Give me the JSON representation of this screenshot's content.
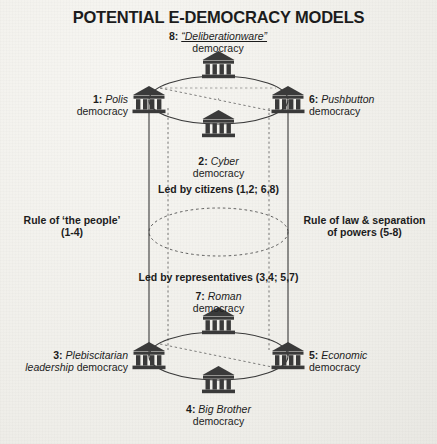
{
  "title": "POTENTIAL E-DEMOCRACY MODELS",
  "diagram": {
    "type": "double-cylinder-axis-model",
    "background_color": "#f3f2ee",
    "ink_color": "#2b2b2b",
    "icon": "greek-temple-icon",
    "nodes": [
      {
        "id": 1,
        "num": "1:",
        "name": "Polis",
        "name2": "democracy",
        "position": "top-ring-west"
      },
      {
        "id": 2,
        "num": "2:",
        "name": "Cyber",
        "name2": "democracy",
        "position": "top-ring-front"
      },
      {
        "id": 3,
        "num": "3:",
        "name": "Plebiscitarian",
        "name2": "leadership democracy",
        "position": "bottom-ring-west"
      },
      {
        "id": 4,
        "num": "4:",
        "name": "Big Brother",
        "name2": "democracy",
        "position": "bottom-ring-front"
      },
      {
        "id": 5,
        "num": "5:",
        "name": "Economic",
        "name2": "democracy",
        "position": "bottom-ring-east"
      },
      {
        "id": 6,
        "num": "6:",
        "name": "Pushbutton",
        "name2": "democracy",
        "position": "top-ring-east"
      },
      {
        "id": 7,
        "num": "7:",
        "name": "Roman",
        "name2": "democracy",
        "position": "bottom-ring-back"
      },
      {
        "id": 8,
        "num": "8:",
        "name": "“Deliberationware”",
        "name2": "democracy",
        "position": "top-ring-back"
      }
    ],
    "axes": {
      "left": {
        "line1": "Rule of ‘the people’",
        "line2": "(1-4)"
      },
      "right": {
        "line1": "Rule of law & separation",
        "line2": "of powers (5-8)"
      },
      "upper_band": "Led by citizens (1,2; 6,8)",
      "lower_band": "Led by representatives (3,4; 5,7)"
    }
  }
}
